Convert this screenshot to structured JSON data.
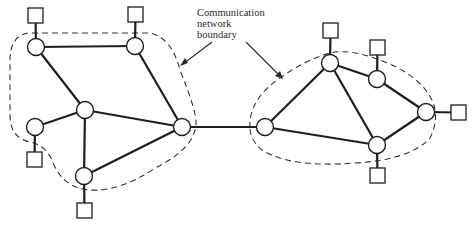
{
  "diagram": {
    "type": "network-topology",
    "label": {
      "lines": [
        "Communication",
        "network",
        "boundary"
      ]
    },
    "colors": {
      "stroke": "#1e1e1e",
      "background": "#ffffff"
    },
    "clusters": [
      {
        "id": "left-network",
        "nodes": [
          {
            "id": "L1",
            "x": 36,
            "y": 47
          },
          {
            "id": "L2",
            "x": 135,
            "y": 46
          },
          {
            "id": "L3",
            "x": 85,
            "y": 110
          },
          {
            "id": "L4",
            "x": 35,
            "y": 127
          },
          {
            "id": "L5",
            "x": 182,
            "y": 127
          },
          {
            "id": "L6",
            "x": 84,
            "y": 176
          }
        ],
        "links": [
          [
            "L1",
            "L2"
          ],
          [
            "L1",
            "L3"
          ],
          [
            "L2",
            "L5"
          ],
          [
            "L3",
            "L4"
          ],
          [
            "L3",
            "L5"
          ],
          [
            "L3",
            "L6"
          ],
          [
            "L6",
            "L5"
          ]
        ],
        "hosts": [
          {
            "node": "L1",
            "x": 28,
            "y": 8
          },
          {
            "node": "L2",
            "x": 128,
            "y": 7
          },
          {
            "node": "L4",
            "x": 27,
            "y": 152
          },
          {
            "node": "L6",
            "x": 77,
            "y": 203
          }
        ]
      },
      {
        "id": "right-network",
        "nodes": [
          {
            "id": "R1",
            "x": 265,
            "y": 127
          },
          {
            "id": "R2",
            "x": 330,
            "y": 63
          },
          {
            "id": "R3",
            "x": 377,
            "y": 79
          },
          {
            "id": "R4",
            "x": 426,
            "y": 112
          },
          {
            "id": "R5",
            "x": 377,
            "y": 145
          }
        ],
        "links": [
          [
            "R1",
            "R2"
          ],
          [
            "R1",
            "R5"
          ],
          [
            "R2",
            "R3"
          ],
          [
            "R2",
            "R5"
          ],
          [
            "R3",
            "R4"
          ],
          [
            "R4",
            "R5"
          ]
        ],
        "hosts": [
          {
            "node": "R2",
            "x": 323,
            "y": 23
          },
          {
            "node": "R3",
            "x": 370,
            "y": 40
          },
          {
            "node": "R4",
            "x": 451,
            "y": 105
          },
          {
            "node": "R5",
            "x": 370,
            "y": 168
          }
        ]
      }
    ],
    "inter_cluster_links": [
      [
        "L5",
        "R1"
      ]
    ]
  }
}
